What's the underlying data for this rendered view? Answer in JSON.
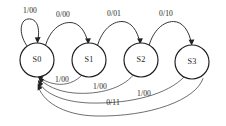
{
  "diagram": {
    "kind": "finite-state-machine-transition-diagram",
    "notation": "input/output",
    "background_color": "#ffffff",
    "line_color": "#2a2a2a",
    "text_color": "#1d1d1d",
    "states": [
      {
        "id": "S0",
        "label": "S0",
        "cx": 37,
        "cy": 60,
        "r": 17
      },
      {
        "id": "S1",
        "label": "S1",
        "cx": 89,
        "cy": 60,
        "r": 17
      },
      {
        "id": "S2",
        "label": "S2",
        "cx": 141,
        "cy": 60,
        "r": 17
      },
      {
        "id": "S3",
        "label": "S3",
        "cx": 192,
        "cy": 62,
        "r": 17
      }
    ],
    "transitions": [
      {
        "id": "t-s0-s0",
        "from": "S0",
        "to": "S0",
        "label": "1/00",
        "label_x": 30,
        "label_y": 11,
        "kind": "self-loop"
      },
      {
        "id": "t-s0-s1",
        "from": "S0",
        "to": "S1",
        "label": "0/00",
        "label_x": 63,
        "label_y": 15,
        "kind": "forward-arc"
      },
      {
        "id": "t-s1-s2",
        "from": "S1",
        "to": "S2",
        "label": "0/01",
        "label_x": 114,
        "label_y": 14,
        "kind": "forward-arc"
      },
      {
        "id": "t-s2-s3",
        "from": "S2",
        "to": "S3",
        "label": "0/10",
        "label_x": 166,
        "label_y": 14,
        "kind": "forward-arc"
      },
      {
        "id": "t-s1-s0",
        "from": "S1",
        "to": "S0",
        "label": "1/00",
        "label_x": 62,
        "label_y": 80,
        "kind": "return-arc"
      },
      {
        "id": "t-s2-s0",
        "from": "S2",
        "to": "S0",
        "label": "1/00",
        "label_x": 100,
        "label_y": 87,
        "kind": "return-arc"
      },
      {
        "id": "t-s3-s0-a",
        "from": "S3",
        "to": "S0",
        "label": "1/00",
        "label_x": 144,
        "label_y": 94,
        "kind": "return-arc"
      },
      {
        "id": "t-s3-s0-b",
        "from": "S3",
        "to": "S0",
        "label": "0/11",
        "label_x": 113,
        "label_y": 103,
        "kind": "return-arc"
      }
    ]
  }
}
